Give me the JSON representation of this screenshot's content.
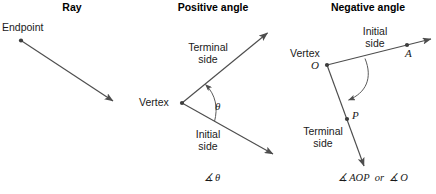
{
  "figure": {
    "background_color": "#ffffff",
    "stroke_color": "#4d4d4d",
    "text_color": "#1a1a1a",
    "width": 436,
    "height": 194
  },
  "panels": [
    {
      "title": "Ray",
      "labels": {
        "endpoint": "Endpoint"
      }
    },
    {
      "title": "Positive angle",
      "labels": {
        "terminal_side_line1": "Terminal",
        "terminal_side_line2": "side",
        "vertex": "Vertex",
        "angle_symbol": "θ",
        "initial_side_line1": "Initial",
        "initial_side_line2": "side"
      },
      "notation": "∡ θ"
    },
    {
      "title": "Negative angle",
      "labels": {
        "initial_side_line1": "Initial",
        "initial_side_line2": "side",
        "vertex": "Vertex",
        "vertex_point": "O",
        "point_a": "A",
        "point_p": "P",
        "terminal_side_line1": "Terminal",
        "terminal_side_line2": "side"
      },
      "notation": "∡ AOP  or  ∡ O"
    }
  ]
}
